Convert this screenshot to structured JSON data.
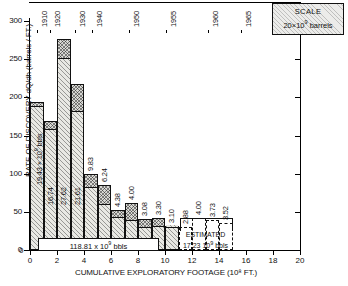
{
  "chart_data": {
    "type": "bar",
    "title": "",
    "xlabel": "CUMULATIVE EXPLORATORY FOOTAGE (10⁸ FT.)",
    "ylabel": "RATE OF DISCOVERY dQ/dh (barrels / FT.)",
    "xlim": [
      0,
      20
    ],
    "ylim": [
      0,
      310
    ],
    "xticks": [
      0,
      2,
      4,
      6,
      8,
      10,
      12,
      14,
      16,
      18,
      20
    ],
    "yticks": [
      0,
      50,
      100,
      150,
      200,
      250,
      300
    ],
    "grid": false,
    "legend": null,
    "scale_note": {
      "title": "SCALE",
      "value": "20×10⁹ barrels"
    },
    "top_axis": {
      "label": "year",
      "ticks": [
        {
          "year": "1910",
          "x": 0.5
        },
        {
          "year": "1920",
          "x": 1.5
        },
        {
          "year": "1930",
          "x": 3.3
        },
        {
          "year": "1940",
          "x": 4.6
        },
        {
          "year": "1950",
          "x": 7.3
        },
        {
          "year": "1955",
          "x": 10.1
        },
        {
          "year": "1960",
          "x": 13.2
        },
        {
          "year": "1965",
          "x": 15.6
        }
      ]
    },
    "bars": [
      {
        "x0": 0.0,
        "x1": 1.0,
        "height": 194,
        "cap_from": 190,
        "volume": "19.43 × 10⁹ bbls",
        "estimated": false
      },
      {
        "x0": 1.0,
        "x1": 2.0,
        "height": 169,
        "cap_from": 160,
        "volume": "16.74",
        "estimated": false
      },
      {
        "x0": 2.0,
        "x1": 3.0,
        "height": 277,
        "cap_from": 253,
        "volume": "27.62",
        "estimated": false
      },
      {
        "x0": 3.0,
        "x1": 4.0,
        "height": 218,
        "cap_from": 184,
        "volume": "21.61",
        "estimated": false
      },
      {
        "x0": 4.0,
        "x1": 5.0,
        "height": 100,
        "cap_from": 84,
        "volume": "9.83",
        "estimated": false
      },
      {
        "x0": 5.0,
        "x1": 6.0,
        "height": 85,
        "cap_from": 62,
        "volume": "6.24",
        "estimated": false
      },
      {
        "x0": 6.0,
        "x1": 7.0,
        "height": 53,
        "cap_from": 44,
        "volume": "4.38",
        "estimated": false
      },
      {
        "x0": 7.0,
        "x1": 8.0,
        "height": 62,
        "cap_from": 40,
        "volume": "4.00",
        "estimated": false
      },
      {
        "x0": 8.0,
        "x1": 9.0,
        "height": 40,
        "cap_from": 31,
        "volume": "3.08",
        "estimated": false
      },
      {
        "x0": 9.0,
        "x1": 10.0,
        "height": 42,
        "cap_from": 33,
        "volume": "3.30",
        "estimated": false
      },
      {
        "x0": 10.0,
        "x1": 11.0,
        "height": 32,
        "cap_from": 32,
        "volume": "3.10",
        "estimated": false
      },
      {
        "x0": 11.0,
        "x1": 12.0,
        "height": 30,
        "cap_from": 30,
        "volume": "2.88",
        "estimated": true
      },
      {
        "x0": 12.0,
        "x1": 13.0,
        "height": 42,
        "cap_from": 42,
        "volume": "4.00",
        "estimated": true
      },
      {
        "x0": 13.0,
        "x1": 14.0,
        "height": 39,
        "cap_from": 39,
        "volume": "3.73",
        "estimated": true
      },
      {
        "x0": 14.0,
        "x1": 15.0,
        "height": 36,
        "cap_from": 36,
        "volume": "3.52",
        "estimated": true
      }
    ],
    "annotations": {
      "cumulative_total": "118.81 x 10⁹ bbls",
      "estimated_label": "ESTIMATED",
      "estimated_total": "17.23  10⁹ bbls"
    }
  }
}
